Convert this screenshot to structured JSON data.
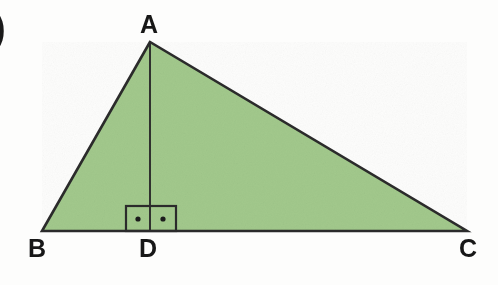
{
  "figure": {
    "kind": "geometry-diagram",
    "item_marker": ")",
    "background_color": "#fdfdfc",
    "fill_color": "#a2c98c",
    "stroke_color": "#2b2b2b",
    "label_color": "#171717",
    "labels": {
      "apex": "A",
      "base_left": "B",
      "foot": "D",
      "base_right": "C"
    },
    "vertices": {
      "A": {
        "x": 150,
        "y": 42
      },
      "B": {
        "x": 42,
        "y": 231
      },
      "C": {
        "x": 467,
        "y": 231
      },
      "D": {
        "x": 150,
        "y": 231
      }
    },
    "segments": [
      {
        "name": "AB",
        "from": "A",
        "to": "B"
      },
      {
        "name": "BC",
        "from": "B",
        "to": "C"
      },
      {
        "name": "CA",
        "from": "C",
        "to": "A"
      },
      {
        "name": "AD",
        "from": "A",
        "to": "D"
      }
    ],
    "right_angle_marks": {
      "count": 2,
      "style": "square-with-dot",
      "box_left": 126,
      "box_right": 176,
      "box_top": 206,
      "box_bottom": 231,
      "split_x": 150,
      "dot_left_x": 138,
      "dot_right_x": 163,
      "dot_y": 219
    }
  }
}
